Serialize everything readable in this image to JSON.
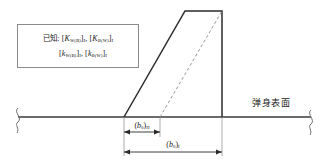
{
  "figure": {
    "background_color": "#ffffff",
    "line_color": "#2b2b2b",
    "dashed_color": "#9a9a9a",
    "box_border_color": "#8b8b8b",
    "width": 329,
    "height": 167
  },
  "given_box": {
    "prefix": "已知:",
    "line1": [
      {
        "bracket_open": "[",
        "symbol": "K",
        "subscript": "W(B)",
        "bracket_close": "]",
        "outer_subscript": "I",
        "separator": ","
      },
      {
        "bracket_open": "[",
        "symbol": "K",
        "subscript": "B(W)",
        "bracket_close": "]",
        "outer_subscript": "I",
        "separator": ""
      }
    ],
    "line2": [
      {
        "bracket_open": "[",
        "symbol": "k",
        "subscript": "W(B)",
        "bracket_close": "]",
        "outer_subscript": "I",
        "separator": ","
      },
      {
        "bracket_open": "[",
        "symbol": "k",
        "subscript": "B(W)",
        "bracket_close": "]",
        "outer_subscript": "I",
        "separator": ""
      }
    ]
  },
  "labels": {
    "body_surface": "弹身表面"
  },
  "dimensions": {
    "upper": {
      "symbol": "b",
      "subscript": "0",
      "outer_subscript": "II",
      "x_start": 124,
      "x_end": 160
    },
    "lower": {
      "symbol": "b",
      "subscript": "0",
      "outer_subscript": "I",
      "x_start": 124,
      "x_end": 222
    }
  },
  "geometry": {
    "baseline_y": 117,
    "baseline_x_start": 18,
    "baseline_x_end": 311,
    "wing": {
      "root_leading_x": 124,
      "root_trailing_x": 222,
      "tip_leading_x": 185,
      "tip_trailing_x": 222,
      "tip_y": 11
    },
    "dashed_line": {
      "x_bottom": 160,
      "y_bottom": 117,
      "x_top": 222,
      "y_top": 11
    },
    "break_symbol_left_x": 18,
    "break_symbol_right_x": 311
  }
}
